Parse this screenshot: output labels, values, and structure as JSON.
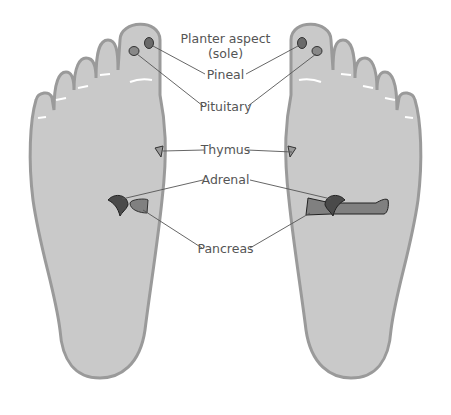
{
  "diagram": {
    "title_line1": "Planter aspect",
    "title_line2": "(sole)",
    "labels": {
      "pineal": "Pineal",
      "pituitary": "Pituitary",
      "thymus": "Thymus",
      "adrenal": "Adrenal",
      "pancreas": "Pancreas"
    },
    "colors": {
      "foot_fill": "#c9c9c9",
      "foot_outline": "#9a9a9a",
      "organ_dark": "#4a4a4a",
      "organ_mid": "#808080",
      "leader_line": "#555555",
      "text": "#555555"
    }
  }
}
